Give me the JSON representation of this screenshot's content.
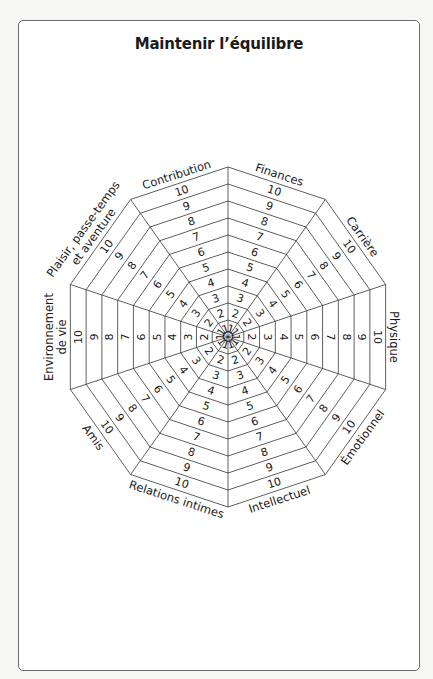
{
  "title": "Maintenir l’équilibre",
  "colors": {
    "line": "#2b2b2b",
    "text": "#1a1a1a",
    "frame": "#6a6a6a",
    "background": "#ffffff"
  },
  "wheel": {
    "center": [
      228,
      337
    ],
    "radius": 170,
    "x_scale": 0.975,
    "rings": 10,
    "ring_labels": [
      "1",
      "2",
      "3",
      "4",
      "5",
      "6",
      "7",
      "8",
      "9",
      "10"
    ],
    "sectors": [
      {
        "id": "finances",
        "label_lines": [
          "Finances"
        ],
        "angle": 72
      },
      {
        "id": "carriere",
        "label_lines": [
          "Carrière"
        ],
        "angle": 36
      },
      {
        "id": "physique",
        "label_lines": [
          "Physique"
        ],
        "angle": 0
      },
      {
        "id": "emotionnel",
        "label_lines": [
          "Émotionnel"
        ],
        "angle": -36
      },
      {
        "id": "intellectuel",
        "label_lines": [
          "Intellectuel"
        ],
        "angle": -72
      },
      {
        "id": "relations-intimes",
        "label_lines": [
          "Relations intimes"
        ],
        "angle": -108
      },
      {
        "id": "amis",
        "label_lines": [
          "Amis"
        ],
        "angle": -144
      },
      {
        "id": "environnement-de-vie",
        "label_lines": [
          "Environnement",
          "de vie"
        ],
        "angle": 180
      },
      {
        "id": "plaisir-passe-temps-aventure",
        "label_lines": [
          "Plaisir, passe-temps",
          "et aventure"
        ],
        "angle": 144
      },
      {
        "id": "contribution",
        "label_lines": [
          "Contribution"
        ],
        "angle": 108
      }
    ]
  }
}
